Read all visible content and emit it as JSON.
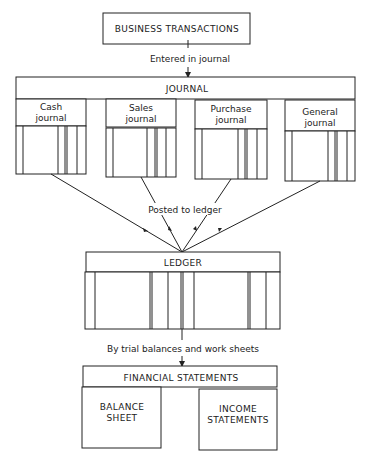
{
  "diagram": {
    "top_box": {
      "label": "BUSINESS TRANSACTIONS"
    },
    "arrow1": {
      "label": "Entered in journal"
    },
    "journal": {
      "title": "JOURNAL",
      "sub_journals": [
        {
          "line1": "Cash",
          "line2": "journal"
        },
        {
          "line1": "Sales",
          "line2": "journal"
        },
        {
          "line1": "Purchase",
          "line2": "journal"
        },
        {
          "line1": "General",
          "line2": "journal"
        }
      ]
    },
    "arrow2": {
      "label": "Posted to ledger"
    },
    "ledger": {
      "title": "LEDGER"
    },
    "arrow3": {
      "label": "By trial balances and work sheets"
    },
    "financial_statements": {
      "title": "FINANCIAL STATEMENTS",
      "items": [
        {
          "line1": "BALANCE",
          "line2": "SHEET"
        },
        {
          "line1": "INCOME",
          "line2": "STATEMENTS"
        }
      ]
    }
  }
}
